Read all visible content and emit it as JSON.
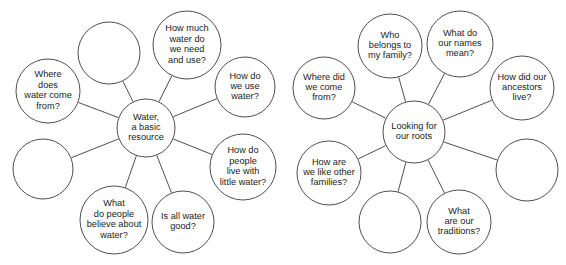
{
  "diagram": {
    "type": "mind-map-pair",
    "background_color": "#ffffff",
    "line_color": "#3b3b3b",
    "text_color": "#1b1b1b",
    "maps": [
      {
        "id": "water-map",
        "center": {
          "label": "Water,\na basic\nresource",
          "lines": [
            "Water,",
            "a basic",
            "resource"
          ],
          "cx": 146,
          "cy": 128,
          "r": 29
        },
        "nodes": [
          {
            "id": "water-node-empty-top",
            "lines": [],
            "cx": 109,
            "cy": 53,
            "r": 31,
            "empty": true
          },
          {
            "id": "water-node-how-much",
            "lines": [
              "How much",
              "water do",
              "we need",
              "and use?"
            ],
            "cx": 187,
            "cy": 45,
            "r": 34,
            "empty": false
          },
          {
            "id": "water-node-where-from",
            "lines": [
              "Where",
              "does",
              "water come",
              "from?"
            ],
            "cx": 48,
            "cy": 91,
            "r": 32,
            "empty": false
          },
          {
            "id": "water-node-how-use",
            "lines": [
              "How do",
              "we use",
              "water?"
            ],
            "cx": 245,
            "cy": 87,
            "r": 30,
            "empty": false
          },
          {
            "id": "water-node-empty-left",
            "lines": [],
            "cx": 43,
            "cy": 169,
            "r": 30,
            "empty": true
          },
          {
            "id": "water-node-little-water",
            "lines": [
              "How do",
              "people",
              "live with",
              "little water?"
            ],
            "cx": 243,
            "cy": 167,
            "r": 33,
            "empty": false
          },
          {
            "id": "water-node-believe",
            "lines": [
              "What",
              "do people",
              "believe about",
              "water?"
            ],
            "cx": 114,
            "cy": 220,
            "r": 34,
            "empty": false
          },
          {
            "id": "water-node-all-good",
            "lines": [
              "Is all water",
              "good?"
            ],
            "cx": 183,
            "cy": 222,
            "r": 31,
            "empty": false
          }
        ]
      },
      {
        "id": "roots-map",
        "center": {
          "label": "Looking for\nour roots",
          "lines": [
            "Looking for",
            "our roots"
          ],
          "cx": 414,
          "cy": 132,
          "r": 31
        },
        "nodes": [
          {
            "id": "roots-node-who-belongs",
            "lines": [
              "Who",
              "belongs to",
              "my family?"
            ],
            "cx": 390,
            "cy": 46,
            "r": 32,
            "empty": false
          },
          {
            "id": "roots-node-names-mean",
            "lines": [
              "What do",
              "our names",
              "mean?"
            ],
            "cx": 460,
            "cy": 44,
            "r": 33,
            "empty": false
          },
          {
            "id": "roots-node-where-from",
            "lines": [
              "Where did",
              "we come",
              "from?"
            ],
            "cx": 324,
            "cy": 88,
            "r": 31,
            "empty": false
          },
          {
            "id": "roots-node-ancestors",
            "lines": [
              "How did our",
              "ancestors",
              "live?"
            ],
            "cx": 522,
            "cy": 88,
            "r": 32,
            "empty": false
          },
          {
            "id": "roots-node-like-others",
            "lines": [
              "How are",
              "we like other",
              "families?"
            ],
            "cx": 329,
            "cy": 173,
            "r": 32,
            "empty": false
          },
          {
            "id": "roots-node-empty-right",
            "lines": [],
            "cx": 527,
            "cy": 170,
            "r": 31,
            "empty": true
          },
          {
            "id": "roots-node-empty-bottom",
            "lines": [],
            "cx": 390,
            "cy": 222,
            "r": 31,
            "empty": true
          },
          {
            "id": "roots-node-traditions",
            "lines": [
              "What",
              "are our",
              "traditions?"
            ],
            "cx": 459,
            "cy": 222,
            "r": 32,
            "empty": false
          }
        ]
      }
    ]
  }
}
